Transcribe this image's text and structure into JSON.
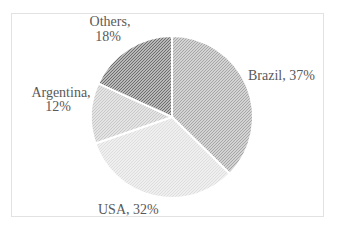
{
  "chart_data": {
    "type": "pie",
    "title": "",
    "categories": [
      "Brazil",
      "USA",
      "Argentina",
      "Others"
    ],
    "values": [
      37,
      32,
      12,
      18
    ],
    "unit": "%",
    "labels": [
      "Brazil, 37%",
      "USA, 32%",
      "Argentina, 12%",
      "Others, 18%"
    ],
    "start_angle_deg": 0,
    "direction": "clockwise",
    "legend_position": "none",
    "slice_fill_style": "diagonal-hatch",
    "slice_hatch_colors": [
      "#a6a6a6",
      "#dedede",
      "#c8c8c8",
      "#6e6e6e"
    ],
    "slice_separator_color": "#ffffff",
    "label_text_color": "#595959",
    "plot_border_color": "#e2e2e2"
  },
  "labels": {
    "brazil": "Brazil, 37%",
    "usa": "USA, 32%",
    "argentina_line1": "Argentina,",
    "argentina_line2": "12%",
    "others_line1": "Others,",
    "others_line2": "18%"
  }
}
